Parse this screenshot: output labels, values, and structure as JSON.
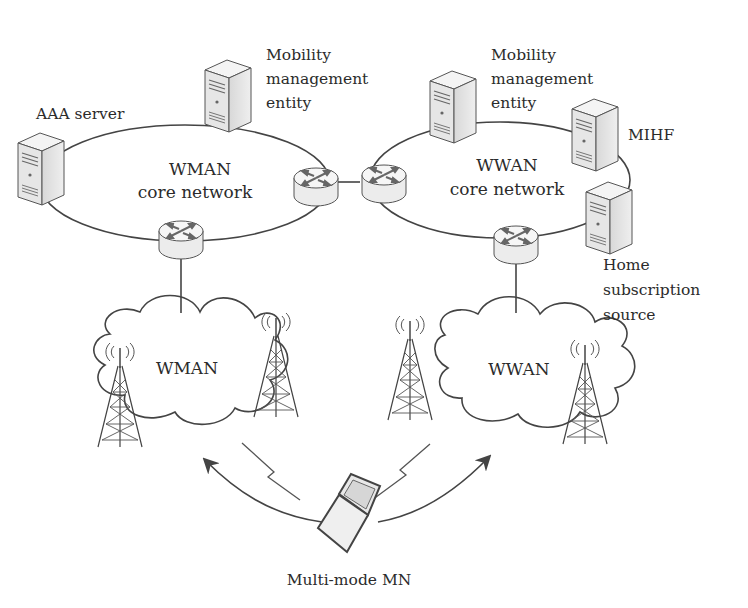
{
  "diagram": {
    "left_core": {
      "title": "WMAN",
      "subtitle": "core network",
      "servers": [
        {
          "id": "aaa",
          "label_lines": [
            "AAA server"
          ]
        },
        {
          "id": "mme-left",
          "label_lines": [
            "Mobility",
            "management",
            "entity"
          ]
        }
      ]
    },
    "right_core": {
      "title": "WWAN",
      "subtitle": "core network",
      "servers": [
        {
          "id": "mme-right",
          "label_lines": [
            "Mobility",
            "management",
            "entity"
          ]
        },
        {
          "id": "mihf",
          "label_lines": [
            "MIHF"
          ]
        },
        {
          "id": "hss",
          "label_lines": [
            "Home",
            "subscription",
            "source"
          ]
        }
      ]
    },
    "left_access": {
      "label": "WMAN"
    },
    "right_access": {
      "label": "WWAN"
    },
    "mobile_node": {
      "label": "Multi-mode MN"
    },
    "icons": [
      "server-icon",
      "router-icon",
      "cell-tower-icon",
      "laptop-icon",
      "wireless-link-icon",
      "cloud-icon"
    ]
  }
}
